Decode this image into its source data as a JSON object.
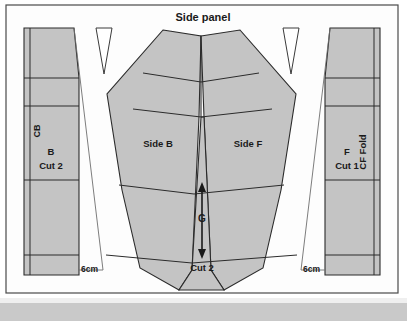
{
  "diagram": {
    "title": "Side panel",
    "type": "sewing-pattern-layout",
    "fill_color": "#c4c4c4",
    "line_color": "#2b2b2b",
    "background_color": "#fdfdfd",
    "footer_color": "#c9c9c9"
  },
  "labels": {
    "title": "Side panel",
    "center_back": "CB",
    "back_piece": "B",
    "back_cut": "Cut 2",
    "side_back": "Side B",
    "side_front": "Side F",
    "grain": "G",
    "center_cut": "Cut 2",
    "front_piece": "F",
    "front_cut": "Cut 1",
    "center_front_fold": "CF Fold",
    "measure_left": "6cm",
    "measure_right": "6cm"
  }
}
